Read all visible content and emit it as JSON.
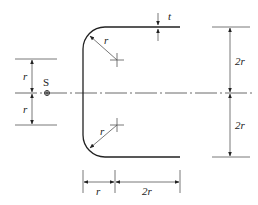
{
  "diagram": {
    "type": "channel-section-shear-center",
    "labels": {
      "shear_center": "S",
      "thickness": "t",
      "radius_top": "r",
      "radius_bottom": "r",
      "left_upper": "r",
      "left_lower": "r",
      "right_upper": "2r",
      "right_lower": "2r",
      "bottom_left": "r",
      "bottom_right": "2r"
    }
  }
}
